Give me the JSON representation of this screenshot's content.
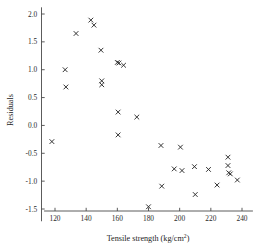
{
  "chart_data": {
    "type": "scatter",
    "title": "",
    "xlabel": "Tensile strength (kg/cm",
    "xlabel_sup": "2",
    "xlabel_tail": ")",
    "ylabel": "Residuals",
    "xlim": [
      113,
      247
    ],
    "ylim": [
      -1.72,
      2.12
    ],
    "xticks": [
      120,
      140,
      160,
      180,
      200,
      220,
      240
    ],
    "xtick_labels": [
      "120",
      "140",
      "160",
      "180",
      "200",
      "220",
      "240"
    ],
    "yticks": [
      2.0,
      1.5,
      1.0,
      0.5,
      0.0,
      -0.5,
      -1.0,
      -1.5
    ],
    "ytick_labels": [
      "2.0",
      "1.5",
      "1.0",
      "0.5",
      "0.0",
      "-0.5",
      "-1.0",
      "-1.5"
    ],
    "grid": false,
    "legend": null,
    "marker": "x",
    "marker_color": "#2a2a2a",
    "points": [
      {
        "x": 118.0,
        "y": -0.29
      },
      {
        "x": 126.5,
        "y": 1.0
      },
      {
        "x": 127.0,
        "y": 0.69
      },
      {
        "x": 133.5,
        "y": 1.65
      },
      {
        "x": 143.0,
        "y": 1.89
      },
      {
        "x": 145.0,
        "y": 1.8
      },
      {
        "x": 149.5,
        "y": 1.35
      },
      {
        "x": 150.0,
        "y": 0.8
      },
      {
        "x": 150.0,
        "y": 0.73
      },
      {
        "x": 160.0,
        "y": 1.13
      },
      {
        "x": 161.0,
        "y": 1.12
      },
      {
        "x": 164.0,
        "y": 1.08
      },
      {
        "x": 160.5,
        "y": 0.24
      },
      {
        "x": 160.5,
        "y": -0.17
      },
      {
        "x": 172.5,
        "y": 0.15
      },
      {
        "x": 180.0,
        "y": -1.46
      },
      {
        "x": 188.0,
        "y": -0.36
      },
      {
        "x": 188.5,
        "y": -1.09
      },
      {
        "x": 196.5,
        "y": -0.78
      },
      {
        "x": 200.5,
        "y": -0.39
      },
      {
        "x": 201.5,
        "y": -0.81
      },
      {
        "x": 209.5,
        "y": -0.74
      },
      {
        "x": 210.0,
        "y": -1.24
      },
      {
        "x": 218.5,
        "y": -0.79
      },
      {
        "x": 224.0,
        "y": -1.07
      },
      {
        "x": 231.0,
        "y": -0.57
      },
      {
        "x": 231.0,
        "y": -0.72
      },
      {
        "x": 231.5,
        "y": -0.85
      },
      {
        "x": 232.5,
        "y": -0.87
      },
      {
        "x": 237.0,
        "y": -0.98
      }
    ]
  }
}
